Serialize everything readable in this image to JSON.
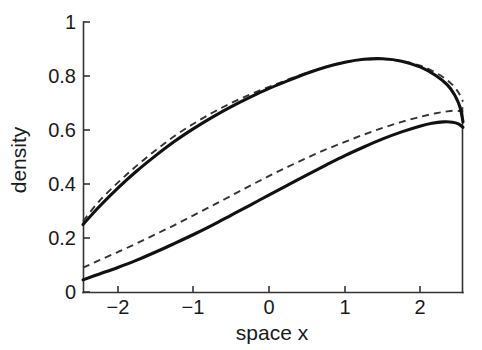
{
  "chart_data": {
    "type": "line",
    "title": "",
    "xlabel": "space x",
    "ylabel": "density",
    "xlim": [
      -2.46,
      2.56
    ],
    "ylim": [
      0,
      1
    ],
    "grid": false,
    "legend": "none",
    "xticks": [
      -2,
      -1,
      0,
      1,
      2
    ],
    "xticklabels": [
      "−2",
      "−1",
      "0",
      "1",
      "2"
    ],
    "yticks": [
      0,
      0.2,
      0.4,
      0.6,
      0.8,
      1
    ],
    "yticklabels": [
      "0",
      "0.2",
      "0.4",
      "0.6",
      "0.8",
      "1"
    ],
    "series": [
      {
        "name": "upper-solid",
        "style": "solid",
        "color": "#111111",
        "x": [
          -2.46,
          -2.25,
          -2.0,
          -1.75,
          -1.5,
          -1.25,
          -1.0,
          -0.75,
          -0.5,
          -0.25,
          0.0,
          0.25,
          0.5,
          0.75,
          1.0,
          1.25,
          1.5,
          1.75,
          2.0,
          2.2,
          2.35,
          2.45,
          2.52,
          2.56
        ],
        "y": [
          0.25,
          0.315,
          0.385,
          0.448,
          0.505,
          0.558,
          0.605,
          0.648,
          0.687,
          0.722,
          0.754,
          0.783,
          0.81,
          0.833,
          0.851,
          0.862,
          0.864,
          0.855,
          0.833,
          0.802,
          0.768,
          0.73,
          0.685,
          0.63
        ]
      },
      {
        "name": "upper-dashed",
        "style": "dashed",
        "color": "#333333",
        "x": [
          -2.46,
          -2.25,
          -2.0,
          -1.75,
          -1.5,
          -1.25,
          -1.0,
          -0.75,
          -0.5,
          -0.25,
          0.0,
          0.25,
          0.5,
          0.75,
          1.0,
          1.25,
          1.5,
          1.75,
          2.0,
          2.2,
          2.35,
          2.45,
          2.52,
          2.56
        ],
        "y": [
          0.262,
          0.335,
          0.405,
          0.468,
          0.525,
          0.578,
          0.623,
          0.664,
          0.7,
          0.732,
          0.76,
          0.787,
          0.812,
          0.834,
          0.851,
          0.861,
          0.863,
          0.856,
          0.838,
          0.812,
          0.785,
          0.758,
          0.73,
          0.705
        ]
      },
      {
        "name": "lower-dashed",
        "style": "dashed",
        "color": "#333333",
        "x": [
          -2.46,
          -2.25,
          -2.0,
          -1.75,
          -1.5,
          -1.25,
          -1.0,
          -0.75,
          -0.5,
          -0.25,
          0.0,
          0.25,
          0.5,
          0.75,
          1.0,
          1.25,
          1.5,
          1.75,
          2.0,
          2.2,
          2.35,
          2.45,
          2.52,
          2.56
        ],
        "y": [
          0.09,
          0.117,
          0.148,
          0.18,
          0.214,
          0.248,
          0.284,
          0.32,
          0.357,
          0.394,
          0.43,
          0.464,
          0.497,
          0.528,
          0.556,
          0.583,
          0.608,
          0.63,
          0.649,
          0.662,
          0.669,
          0.672,
          0.67,
          0.665
        ]
      },
      {
        "name": "lower-solid",
        "style": "solid",
        "color": "#111111",
        "x": [
          -2.46,
          -2.25,
          -2.0,
          -1.75,
          -1.5,
          -1.25,
          -1.0,
          -0.75,
          -0.5,
          -0.25,
          0.0,
          0.25,
          0.5,
          0.75,
          1.0,
          1.25,
          1.5,
          1.75,
          2.0,
          2.15,
          2.3,
          2.42,
          2.5,
          2.56
        ],
        "y": [
          0.045,
          0.066,
          0.091,
          0.118,
          0.148,
          0.18,
          0.213,
          0.248,
          0.285,
          0.322,
          0.36,
          0.397,
          0.434,
          0.47,
          0.505,
          0.537,
          0.567,
          0.593,
          0.615,
          0.625,
          0.63,
          0.629,
          0.623,
          0.61
        ]
      }
    ]
  },
  "axis": {
    "xlabel": "space x",
    "ylabel": "density"
  }
}
